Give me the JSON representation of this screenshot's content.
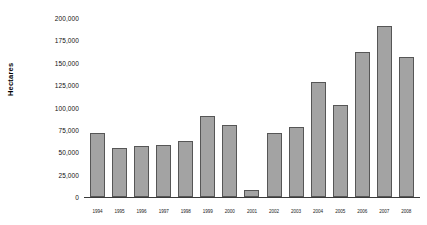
{
  "chart_data": {
    "type": "bar",
    "title": "",
    "xlabel": "",
    "ylabel": "Hectares",
    "ylim": [
      0,
      200000
    ],
    "grid": false,
    "legend": null,
    "ytick_labels": [
      "200,000",
      "175,000",
      "150,000",
      "125,000",
      "100,000",
      "75,000",
      "50,000",
      "25,000",
      "0"
    ],
    "ytick_values": [
      200000,
      175000,
      150000,
      125000,
      100000,
      75000,
      50000,
      25000,
      0
    ],
    "categories": [
      "1994",
      "1995",
      "1996",
      "1997",
      "1998",
      "1999",
      "2000",
      "2001",
      "2002",
      "2003",
      "2004",
      "2005",
      "2006",
      "2007",
      "2008"
    ],
    "values": [
      71000,
      55000,
      57000,
      58000,
      63000,
      90000,
      80000,
      8000,
      72000,
      78000,
      129000,
      103000,
      162000,
      191000,
      156000
    ],
    "bar_color": "#a3a3a3",
    "bar_border_color": "#565656",
    "axis_color": "#3a3a3a",
    "background_color": "#ffffff"
  }
}
